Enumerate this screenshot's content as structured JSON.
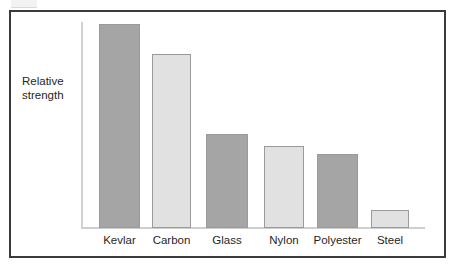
{
  "chart_data": {
    "type": "bar",
    "title": "",
    "xlabel": "",
    "ylabel": "Relative\nstrength",
    "categories": [
      "Kevlar",
      "Carbon",
      "Glass",
      "Nylon",
      "Polyester",
      "Steel"
    ],
    "values": [
      100,
      85,
      46,
      40,
      36,
      8
    ],
    "ylim": [
      0,
      100
    ],
    "grid": false,
    "legend": false,
    "axis_tick_labels": [],
    "bar_colors": [
      "#a5a5a5",
      "#e1e1e1",
      "#a5a5a5",
      "#e1e1e1",
      "#a5a5a5",
      "#e1e1e1"
    ],
    "bar_outline_color": "#9a9a9a",
    "axis_color": "#cfcfcf",
    "frame_color": "#3b3b3b",
    "background": "#ffffff",
    "bars": [
      {
        "label": "Kevlar",
        "value": 100,
        "color": "#a5a5a5",
        "left": 99,
        "width": 41,
        "top": 24,
        "height": 204
      },
      {
        "label": "Carbon",
        "value": 85,
        "color": "#e1e1e1",
        "left": 152,
        "width": 39,
        "top": 54,
        "height": 174
      },
      {
        "label": "Glass",
        "value": 46,
        "color": "#a5a5a5",
        "left": 206,
        "width": 42,
        "top": 134,
        "height": 94
      },
      {
        "label": "Nylon",
        "value": 40,
        "color": "#e1e1e1",
        "left": 264,
        "width": 40,
        "top": 146,
        "height": 82
      },
      {
        "label": "Polyester",
        "value": 36,
        "color": "#a5a5a5",
        "left": 317,
        "width": 41,
        "top": 154,
        "height": 74
      },
      {
        "label": "Steel",
        "value": 8,
        "color": "#e1e1e1",
        "left": 371,
        "width": 38,
        "top": 210,
        "height": 18
      }
    ]
  }
}
